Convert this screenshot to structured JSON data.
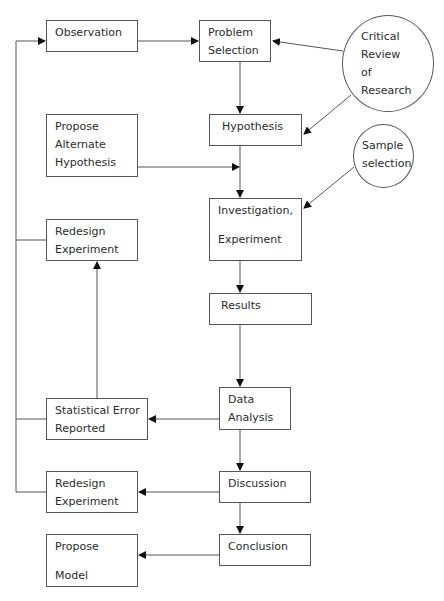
{
  "diagram": {
    "type": "flowchart",
    "nodes": {
      "observation": {
        "lines": [
          "Observation"
        ]
      },
      "problem_selection": {
        "lines": [
          "Problem",
          "Selection"
        ]
      },
      "critical_review": {
        "lines": [
          "Critical",
          "Review",
          "of",
          "Research"
        ]
      },
      "hypothesis": {
        "lines": [
          "Hypothesis"
        ]
      },
      "propose_alternate": {
        "lines": [
          "Propose",
          "Alternate",
          "Hypothesis"
        ]
      },
      "sample_selection": {
        "lines": [
          "Sample",
          "selection"
        ]
      },
      "investigation": {
        "lines": [
          "Investigation,",
          "Experiment"
        ]
      },
      "redesign_upper": {
        "lines": [
          "Redesign",
          "Experiment"
        ]
      },
      "results": {
        "lines": [
          "Results"
        ]
      },
      "data_analysis": {
        "lines": [
          "Data",
          "Analysis"
        ]
      },
      "statistical_error": {
        "lines": [
          "Statistical Error",
          "Reported"
        ]
      },
      "discussion": {
        "lines": [
          "Discussion"
        ]
      },
      "redesign_lower": {
        "lines": [
          "Redesign",
          "Experiment"
        ]
      },
      "conclusion": {
        "lines": [
          "Conclusion"
        ]
      },
      "propose_model": {
        "lines": [
          "Propose",
          "Model"
        ]
      }
    },
    "edges": [
      {
        "from": "Observation",
        "to": "Problem Selection"
      },
      {
        "from": "Critical Review of Research",
        "to": "Problem Selection"
      },
      {
        "from": "Critical Review of Research",
        "to": "Hypothesis"
      },
      {
        "from": "Problem Selection",
        "to": "Hypothesis"
      },
      {
        "from": "Hypothesis",
        "to": "Investigation, Experiment"
      },
      {
        "from": "Propose Alternate Hypothesis",
        "to": "Investigation, Experiment"
      },
      {
        "from": "Sample selection",
        "to": "Investigation, Experiment"
      },
      {
        "from": "Investigation, Experiment",
        "to": "Results"
      },
      {
        "from": "Results",
        "to": "Data Analysis"
      },
      {
        "from": "Data Analysis",
        "to": "Statistical Error Reported"
      },
      {
        "from": "Statistical Error Reported",
        "to": "Redesign Experiment (upper)"
      },
      {
        "from": "Data Analysis",
        "to": "Discussion"
      },
      {
        "from": "Discussion",
        "to": "Redesign Experiment (lower)"
      },
      {
        "from": "Discussion",
        "to": "Conclusion"
      },
      {
        "from": "Conclusion",
        "to": "Propose Model"
      },
      {
        "from": "Redesign Experiment / Statistical Error Reported (feedback loop)",
        "to": "Observation"
      }
    ],
    "colors": {
      "stroke": "#555555",
      "text": "#2b2b2b",
      "background": "#ffffff"
    }
  }
}
